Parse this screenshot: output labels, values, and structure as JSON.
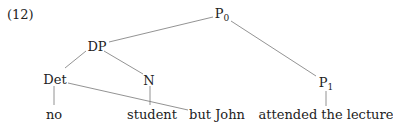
{
  "example_number": "(12)",
  "nodes": {
    "p0": {
      "label": "P",
      "sub": "0"
    },
    "dp": {
      "label": "DP"
    },
    "det": {
      "label": "Det"
    },
    "n": {
      "label": "N"
    },
    "p1": {
      "label": "P",
      "sub": "1"
    }
  },
  "leaves": {
    "no": "no",
    "student": "student",
    "but_john": "but John",
    "attended": "attended the lecture"
  },
  "colors": {
    "edge": "#777777",
    "text": "#222222"
  }
}
